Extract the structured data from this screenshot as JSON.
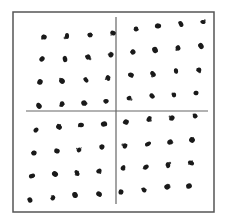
{
  "figure": {
    "colors": {
      "background": "#ffffff",
      "frame": "#555555",
      "axis": "#666666",
      "dot": "#1a1a1a"
    },
    "frame": {
      "x1": 13,
      "y1": 12,
      "x2": 214,
      "y2": 212
    },
    "vertical_line": {
      "x": 116,
      "y1": 17,
      "y2": 204
    },
    "horizontal_line": {
      "y": 111,
      "x1": 26,
      "x2": 208
    },
    "quadrants": [
      {
        "name": "top-left",
        "dots": [
          [
            44,
            37
          ],
          [
            67,
            36
          ],
          [
            90,
            35
          ],
          [
            113,
            33
          ],
          [
            42,
            59
          ],
          [
            65,
            59
          ],
          [
            88,
            57
          ],
          [
            111,
            55
          ],
          [
            40,
            82
          ],
          [
            62,
            81
          ],
          [
            86,
            80
          ],
          [
            108,
            78
          ],
          [
            39,
            106
          ],
          [
            62,
            104
          ],
          [
            84,
            103
          ],
          [
            106,
            101
          ]
        ]
      },
      {
        "name": "top-right",
        "dots": [
          [
            136,
            29
          ],
          [
            158,
            26
          ],
          [
            181,
            24
          ],
          [
            203,
            22
          ],
          [
            133,
            52
          ],
          [
            155,
            50
          ],
          [
            178,
            48
          ],
          [
            201,
            46
          ],
          [
            131,
            75
          ],
          [
            153,
            74
          ],
          [
            176,
            71
          ],
          [
            199,
            70
          ],
          [
            129,
            98
          ],
          [
            152,
            96
          ],
          [
            174,
            95
          ],
          [
            196,
            93
          ]
        ]
      },
      {
        "name": "bottom-left",
        "dots": [
          [
            36,
            130
          ],
          [
            59,
            127
          ],
          [
            81,
            125
          ],
          [
            104,
            124
          ],
          [
            34,
            153
          ],
          [
            57,
            151
          ],
          [
            79,
            150
          ],
          [
            102,
            147
          ],
          [
            32,
            176
          ],
          [
            55,
            174
          ],
          [
            77,
            173
          ],
          [
            99,
            171
          ],
          [
            30,
            200
          ],
          [
            53,
            198
          ],
          [
            75,
            195
          ],
          [
            99,
            194
          ]
        ]
      },
      {
        "name": "bottom-right",
        "dots": [
          [
            126,
            122
          ],
          [
            149,
            119
          ],
          [
            172,
            118
          ],
          [
            195,
            116
          ],
          [
            125,
            146
          ],
          [
            148,
            144
          ],
          [
            170,
            142
          ],
          [
            192,
            140
          ],
          [
            123,
            168
          ],
          [
            146,
            167
          ],
          [
            168,
            165
          ],
          [
            191,
            163
          ],
          [
            121,
            192
          ],
          [
            144,
            190
          ],
          [
            167,
            187
          ],
          [
            189,
            186
          ]
        ]
      }
    ]
  }
}
